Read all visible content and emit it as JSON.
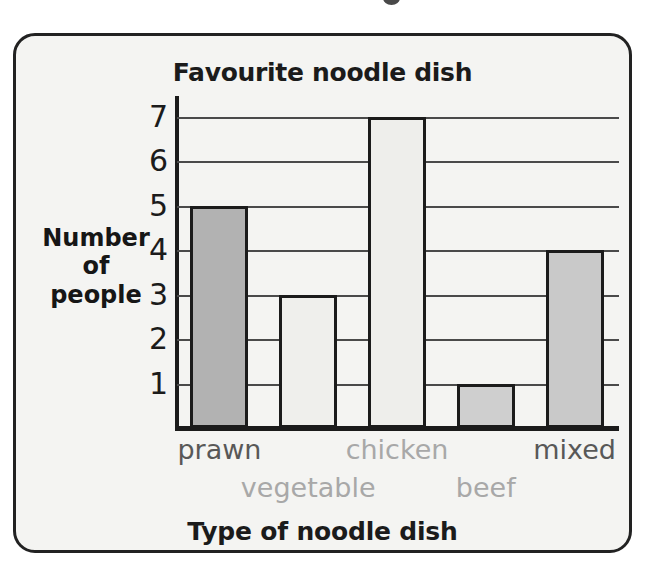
{
  "chart_data": {
    "type": "bar",
    "title": "Favourite noodle dish",
    "xlabel": "Type of noodle dish",
    "ylabel": "Number of people",
    "ylabel_lines": [
      "Number",
      "of",
      "people"
    ],
    "categories": [
      "prawn",
      "vegetable",
      "chicken",
      "beef",
      "mixed"
    ],
    "values": [
      5,
      3,
      7,
      1,
      4
    ],
    "ytick_labels": [
      "1",
      "2",
      "3",
      "4",
      "5",
      "6",
      "7"
    ],
    "ytick_values": [
      1,
      2,
      3,
      4,
      5,
      6,
      7
    ],
    "ylim": [
      0,
      7.5
    ],
    "grid": true,
    "grid_axis": "y",
    "legend": "none",
    "bar_colors": [
      "#b2b2b2",
      "#efefec",
      "#eeeeeb",
      "#cfcfcf",
      "#c9c9c9"
    ],
    "bar_edge_color": "#1b1b1b",
    "plot_background": "#f4f4f2",
    "frame_color": "#222222",
    "label_colors": [
      "#585858",
      "#b1b1b1",
      "#9a9a9a",
      "#8d8d8d",
      "#4e4e4e"
    ],
    "bars": [
      {
        "category": "prawn",
        "value": 5,
        "color": "#b2b2b2",
        "label_row": "top",
        "label_tone": "dark"
      },
      {
        "category": "vegetable",
        "value": 3,
        "color": "#efefec",
        "label_row": "bottom",
        "label_tone": "light"
      },
      {
        "category": "chicken",
        "value": 7,
        "color": "#eeeeeb",
        "label_row": "top",
        "label_tone": "light"
      },
      {
        "category": "beef",
        "value": 1,
        "color": "#cfcfcf",
        "label_row": "bottom",
        "label_tone": "light"
      },
      {
        "category": "mixed",
        "value": 4,
        "color": "#c9c9c9",
        "label_row": "top",
        "label_tone": "dark"
      }
    ]
  },
  "chart": {
    "title": "Favourite noodle dish",
    "x_axis_title": "Type of noodle dish",
    "y_axis_title_line1": "Number",
    "y_axis_title_line2": "of",
    "y_axis_title_line3": "people",
    "y_ticks": [
      "7",
      "6",
      "5",
      "4",
      "3",
      "2",
      "1"
    ],
    "labels": {
      "prawn": "prawn",
      "vegetable": "vegetable",
      "chicken": "chicken",
      "beef": "beef",
      "mixed": "mixed"
    }
  }
}
